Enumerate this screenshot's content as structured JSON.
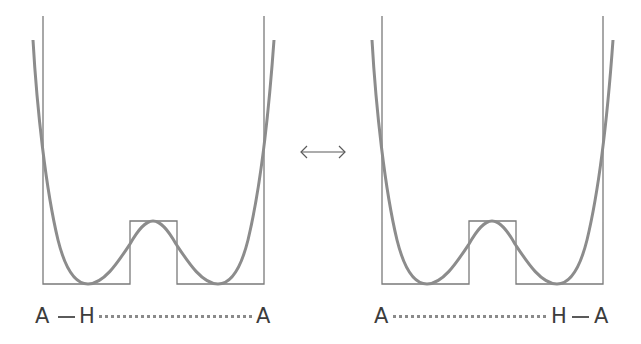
{
  "diagram": {
    "colors": {
      "well_outline": "#7a7a7a",
      "potential_curve": "#8c8c8c",
      "text": "#3c3c3c",
      "bond": "#5a5a5a",
      "hydrogen_bond": "#8a8a8a"
    },
    "equilibrium_symbol": "⟷",
    "panels": [
      {
        "id": "left",
        "atoms": {
          "left": "A",
          "hydrogen": "H",
          "right": "A"
        },
        "description": "A—H covalently bonded to left A, hydrogen-bonded to right A",
        "covalent_side": "left"
      },
      {
        "id": "right",
        "atoms": {
          "left": "A",
          "hydrogen": "H",
          "right": "A"
        },
        "description": "H covalently bonded to right A, hydrogen-bonded to left A",
        "covalent_side": "right"
      }
    ]
  }
}
